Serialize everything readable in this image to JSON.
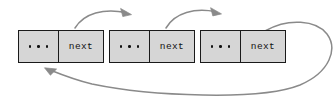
{
  "diagram": {
    "colors": {
      "node_fill": "#d6d6d6",
      "node_border": "#1a1a1a",
      "arrow": "#8a8a8a",
      "text": "#111111",
      "background": "#ffffff"
    },
    "nodes": [
      {
        "id": "node-1",
        "data_label": "...",
        "pointer_label": "next"
      },
      {
        "id": "node-2",
        "data_label": "...",
        "pointer_label": "next"
      },
      {
        "id": "node-3",
        "data_label": "...",
        "pointer_label": "next"
      }
    ],
    "arrows": [
      {
        "id": "arrow-node1-to-node2",
        "from": "node-1-next",
        "to": "node-2",
        "style": "curved-over-top"
      },
      {
        "id": "arrow-node2-to-node3",
        "from": "node-2-next",
        "to": "node-3",
        "style": "curved-over-top"
      },
      {
        "id": "arrow-node3-to-node1",
        "from": "node-3-next",
        "to": "node-1",
        "style": "large-loop-around-bottom"
      }
    ]
  }
}
